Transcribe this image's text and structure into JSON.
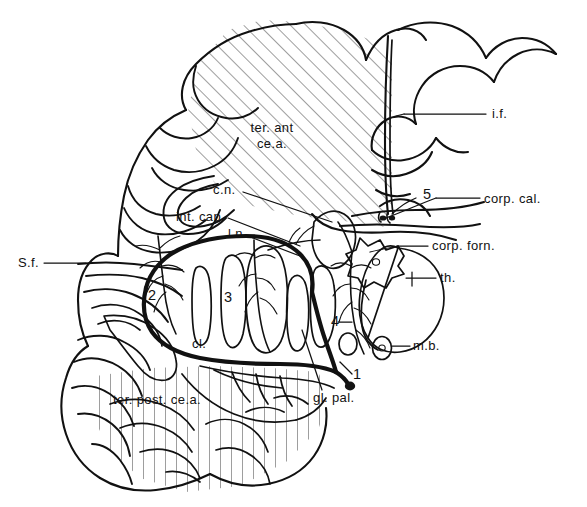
{
  "figure": {
    "kind": "anatomical-line-drawing",
    "background_color": "#ffffff",
    "ink_color": "#111111",
    "width": 587,
    "height": 507
  },
  "labels": [
    {
      "id": "ter-ant-ce-a",
      "name": "territory-anterior-cerebral-artery",
      "line1": "ter. ant",
      "line2": "ce.a.",
      "x": 272,
      "y": 132,
      "anchor": "middle",
      "leader": false
    },
    {
      "id": "i-f",
      "name": "interhemispheric-fissure",
      "text": "i.f.",
      "x": 492,
      "y": 118,
      "anchor": "start",
      "leader": true
    },
    {
      "id": "corp-cal",
      "name": "corpus-callosum",
      "text": "corp. cal.",
      "x": 484,
      "y": 203,
      "anchor": "start",
      "leader": true
    },
    {
      "id": "corp-forn",
      "name": "corpus-fornicis",
      "text": "corp. forn.",
      "x": 432,
      "y": 250,
      "anchor": "start",
      "leader": true
    },
    {
      "id": "th",
      "name": "thalamus",
      "text": "th.",
      "x": 440,
      "y": 282,
      "anchor": "start",
      "leader": true
    },
    {
      "id": "m-b",
      "name": "mammillary-body",
      "text": "m.b.",
      "x": 413,
      "y": 350,
      "anchor": "start",
      "leader": true
    },
    {
      "id": "c-n",
      "name": "caudate-nucleus",
      "text": "c.n.",
      "x": 213,
      "y": 194,
      "anchor": "start",
      "leader": true
    },
    {
      "id": "int-cap",
      "name": "internal-capsule",
      "text": "int. cap.",
      "x": 176,
      "y": 221,
      "anchor": "start",
      "leader": true
    },
    {
      "id": "l-n",
      "name": "lentiform-nucleus",
      "text": "l.n.",
      "x": 228,
      "y": 238,
      "anchor": "start",
      "leader": true
    },
    {
      "id": "s-f",
      "name": "sylvian-fissure",
      "text": "S.f.",
      "x": 18,
      "y": 267,
      "anchor": "start",
      "leader": true
    },
    {
      "id": "cl",
      "name": "claustrum",
      "text": "cl.",
      "x": 192,
      "y": 348,
      "anchor": "start",
      "leader": false
    },
    {
      "id": "gl-pal",
      "name": "globus-pallidus",
      "text": "gl. pal.",
      "x": 313,
      "y": 402,
      "anchor": "start",
      "leader": true
    },
    {
      "id": "ter-post-ce-a",
      "name": "territory-posterior-cerebral-artery",
      "text": "ter. post. ce.a.",
      "x": 113,
      "y": 404,
      "anchor": "start",
      "leader": false
    }
  ],
  "numbered_markers": [
    {
      "id": "marker-1",
      "name": "marker-1",
      "text": "1",
      "x": 353,
      "y": 379
    },
    {
      "id": "marker-2",
      "name": "marker-2",
      "text": "2",
      "x": 148,
      "y": 300
    },
    {
      "id": "marker-3",
      "name": "marker-3",
      "text": "3",
      "x": 224,
      "y": 302
    },
    {
      "id": "marker-4",
      "name": "marker-4",
      "text": "4",
      "x": 331,
      "y": 326
    },
    {
      "id": "marker-5",
      "name": "marker-5",
      "text": "5",
      "x": 423,
      "y": 199
    }
  ],
  "hatching": {
    "anterior_territory": {
      "name": "diagonal-hatch-anterior",
      "style": "diagonal-45",
      "spacing_px": 11,
      "stroke": "#1a1a1a"
    },
    "posterior_territory": {
      "name": "vertical-hatch-posterior",
      "style": "vertical",
      "spacing_px": 11,
      "stroke": "#1a1a1a"
    }
  },
  "stippled_nuclei": {
    "name": "stippled-deep-nuclei",
    "description": "lentiform nucleus laminae, caudate head and claustrum rendered with dot stipple",
    "count": 6
  }
}
